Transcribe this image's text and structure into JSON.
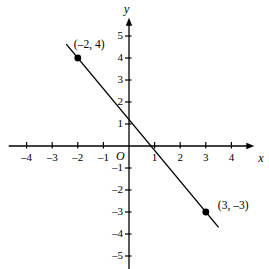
{
  "figure": {
    "background_color": "#ffffff",
    "ink_color": "#000000",
    "width": 269,
    "height": 269
  },
  "chart_data": {
    "type": "line",
    "title": "",
    "xlabel": "x",
    "ylabel": "y",
    "origin_label": "O",
    "grid": false,
    "legend": "none",
    "xlim": [
      -4.7,
      4.7
    ],
    "ylim": [
      -5.6,
      5.6
    ],
    "x_ticks": [
      -4,
      -3,
      -2,
      -1,
      1,
      2,
      3,
      4
    ],
    "y_ticks": [
      5,
      4,
      3,
      2,
      1,
      -1,
      -2,
      -3,
      -4,
      -5
    ],
    "x_tick_labels": [
      "–4",
      "–3",
      "–2",
      "–1",
      "1",
      "2",
      "3",
      "4"
    ],
    "y_tick_labels": [
      "5",
      "4",
      "3",
      "2",
      "1",
      "–1",
      "–2",
      "–3",
      "–4",
      "–5"
    ],
    "series": [
      {
        "name": "line",
        "slope": -1.4,
        "intercept": 1.2,
        "x_start": -2.45,
        "x_end": 3.5,
        "points": [
          {
            "x": -2,
            "y": 4,
            "label": "(–2, 4)"
          },
          {
            "x": 3,
            "y": -3,
            "label": "(3, –3)"
          }
        ]
      }
    ]
  },
  "axes": {
    "x_axis_name": "x",
    "y_axis_name": "y",
    "origin": "O"
  },
  "points": [
    {
      "label": "(–2, 4)",
      "x": -2,
      "y": 4
    },
    {
      "label": "(3, –3)",
      "x": 3,
      "y": -3
    }
  ]
}
